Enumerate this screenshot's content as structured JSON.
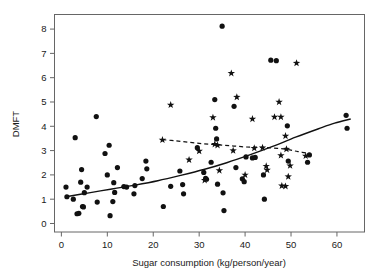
{
  "chart_data": {
    "type": "scatter",
    "title": "",
    "xlabel": "Sugar consumption (kg/person/year)",
    "ylabel": "DMFT",
    "xlim": [
      -1.5,
      66
    ],
    "ylim": [
      -0.35,
      8.6
    ],
    "xticks": [
      0,
      10,
      20,
      30,
      40,
      50,
      60
    ],
    "yticks": [
      0,
      1,
      2,
      3,
      4,
      5,
      6,
      7,
      8
    ],
    "xtick_labels": [
      "0",
      "10",
      "20",
      "30",
      "40",
      "50",
      "60"
    ],
    "ytick_labels": [
      "0",
      "1",
      "2",
      "3",
      "4",
      "5",
      "6",
      "7",
      "8"
    ],
    "grid": false,
    "legend": "none",
    "series": [
      {
        "name": "Circle markers",
        "marker": "filled-circle",
        "color": "#111111",
        "points": [
          [
            1.0,
            1.5
          ],
          [
            1.2,
            1.1
          ],
          [
            2.6,
            1.0
          ],
          [
            3.0,
            3.53
          ],
          [
            3.4,
            0.4
          ],
          [
            3.8,
            0.42
          ],
          [
            4.2,
            1.7
          ],
          [
            4.4,
            2.22
          ],
          [
            4.6,
            0.7
          ],
          [
            4.8,
            0.68
          ],
          [
            5.0,
            1.27
          ],
          [
            5.6,
            1.5
          ],
          [
            7.6,
            4.4
          ],
          [
            7.8,
            0.88
          ],
          [
            9.5,
            2.88
          ],
          [
            10.0,
            2.0
          ],
          [
            10.4,
            3.22
          ],
          [
            10.6,
            0.32
          ],
          [
            11.2,
            0.9
          ],
          [
            11.4,
            1.68
          ],
          [
            11.6,
            1.28
          ],
          [
            12.2,
            2.3
          ],
          [
            13.6,
            1.52
          ],
          [
            14.2,
            1.5
          ],
          [
            15.8,
            1.22
          ],
          [
            16.0,
            1.56
          ],
          [
            17.6,
            1.85
          ],
          [
            18.4,
            2.57
          ],
          [
            18.6,
            2.25
          ],
          [
            22.2,
            0.7
          ],
          [
            23.8,
            1.53
          ],
          [
            25.8,
            2.16
          ],
          [
            26.4,
            1.6
          ],
          [
            26.6,
            1.22
          ],
          [
            29.6,
            3.12
          ],
          [
            31.0,
            2.1
          ],
          [
            31.4,
            1.86
          ],
          [
            31.6,
            1.82
          ],
          [
            32.6,
            2.52
          ],
          [
            33.4,
            5.1
          ],
          [
            33.6,
            3.92
          ],
          [
            33.8,
            3.48
          ],
          [
            34.0,
            1.62
          ],
          [
            35.0,
            8.12
          ],
          [
            35.2,
            1.26
          ],
          [
            35.4,
            0.53
          ],
          [
            37.6,
            4.82
          ],
          [
            38.0,
            2.3
          ],
          [
            39.4,
            1.84
          ],
          [
            39.8,
            1.72
          ],
          [
            40.2,
            2.74
          ],
          [
            41.6,
            2.7
          ],
          [
            42.2,
            2.72
          ],
          [
            44.0,
            2.0
          ],
          [
            44.2,
            1.0
          ],
          [
            45.6,
            6.72
          ],
          [
            46.8,
            6.7
          ],
          [
            49.2,
            4.02
          ],
          [
            49.4,
            2.57
          ],
          [
            53.6,
            2.52
          ],
          [
            54.0,
            2.82
          ],
          [
            62.0,
            4.45
          ],
          [
            62.2,
            3.92
          ]
        ]
      },
      {
        "name": "Star markers",
        "marker": "star",
        "color": "#111111",
        "points": [
          [
            22.0,
            3.44
          ],
          [
            23.8,
            4.88
          ],
          [
            27.8,
            2.62
          ],
          [
            30.0,
            2.98
          ],
          [
            31.2,
            1.78
          ],
          [
            33.0,
            4.36
          ],
          [
            33.4,
            3.26
          ],
          [
            34.0,
            3.22
          ],
          [
            34.4,
            2.18
          ],
          [
            37.0,
            6.18
          ],
          [
            37.4,
            3.0
          ],
          [
            38.2,
            5.2
          ],
          [
            40.0,
            2.0
          ],
          [
            41.6,
            4.3
          ],
          [
            42.0,
            3.1
          ],
          [
            43.8,
            3.12
          ],
          [
            44.6,
            2.36
          ],
          [
            44.8,
            2.2
          ],
          [
            46.4,
            4.38
          ],
          [
            47.4,
            5.0
          ],
          [
            47.8,
            4.38
          ],
          [
            47.8,
            2.8
          ],
          [
            48.0,
            1.55
          ],
          [
            48.8,
            1.53
          ],
          [
            48.8,
            3.6
          ],
          [
            49.0,
            3.06
          ],
          [
            49.4,
            1.93
          ],
          [
            49.8,
            2.38
          ],
          [
            51.2,
            6.6
          ],
          [
            53.2,
            2.78
          ]
        ]
      }
    ],
    "fits": [
      {
        "name": "Solid fitted curve (circles)",
        "style": "solid",
        "points": [
          [
            1.0,
            1.1
          ],
          [
            6.0,
            1.26
          ],
          [
            11.0,
            1.42
          ],
          [
            16.0,
            1.58
          ],
          [
            21.0,
            1.76
          ],
          [
            26.0,
            1.98
          ],
          [
            31.0,
            2.22
          ],
          [
            36.0,
            2.5
          ],
          [
            41.0,
            2.82
          ],
          [
            46.0,
            3.17
          ],
          [
            51.0,
            3.55
          ],
          [
            56.0,
            3.9
          ],
          [
            59.5,
            4.13
          ],
          [
            63.0,
            4.3
          ]
        ]
      },
      {
        "name": "Dashed fitted curve (stars)",
        "style": "dashed",
        "points": [
          [
            22.0,
            3.45
          ],
          [
            25.0,
            3.4
          ],
          [
            28.0,
            3.34
          ],
          [
            31.0,
            3.28
          ],
          [
            34.0,
            3.24
          ],
          [
            37.0,
            3.2
          ],
          [
            40.0,
            3.15
          ],
          [
            43.0,
            3.14
          ],
          [
            46.0,
            3.11
          ],
          [
            49.0,
            3.05
          ],
          [
            51.5,
            2.96
          ],
          [
            54.0,
            2.88
          ]
        ]
      }
    ]
  }
}
